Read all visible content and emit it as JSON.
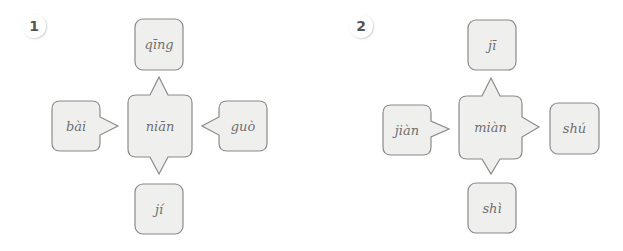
{
  "diagrams": [
    {
      "number": "1",
      "center": "niān",
      "top": "qīng",
      "left": "bài",
      "right": "guò",
      "bottom": "jí",
      "arrows": {
        "top": "out",
        "bottom": "out",
        "left": "in",
        "right": "in"
      }
    },
    {
      "number": "2",
      "center": "miàn",
      "top": "jī",
      "left": "jiàn",
      "right": "shú",
      "bottom": "shì",
      "arrows": {
        "top": "out",
        "bottom": "out",
        "left": "in",
        "right": "out"
      }
    }
  ],
  "colors": {
    "box_fill": "#efefee",
    "box_stroke": "#8a8a8a",
    "text": "#707070"
  }
}
